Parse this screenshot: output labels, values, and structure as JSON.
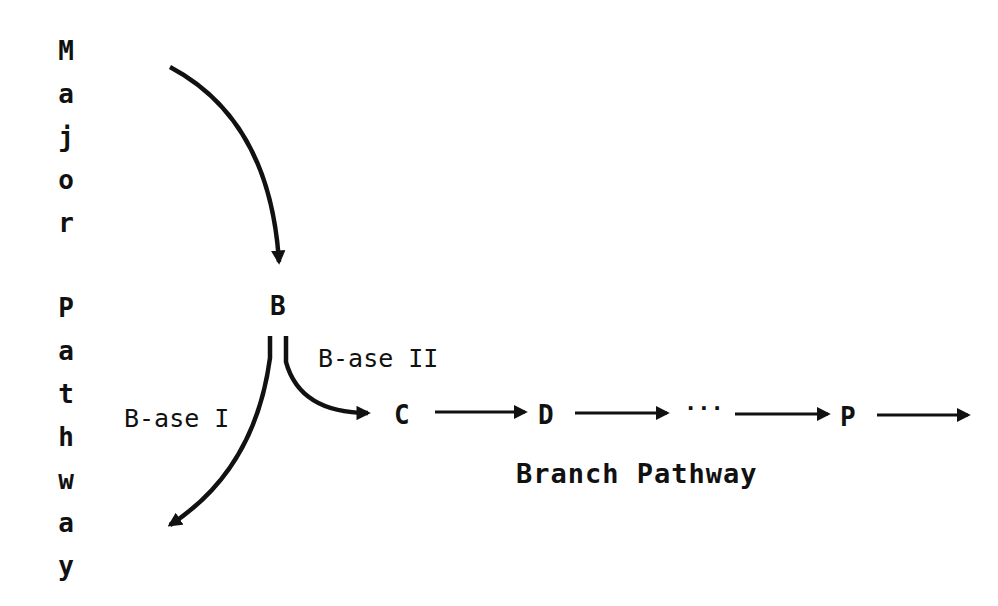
{
  "major_pathway": {
    "label": "Major Pathway",
    "letters": [
      "M",
      "a",
      "j",
      "o",
      "r",
      "P",
      "a",
      "t",
      "h",
      "w",
      "a",
      "y"
    ]
  },
  "nodes": {
    "b": "B",
    "c": "C",
    "d": "D",
    "ellipsis": "···",
    "p": "P"
  },
  "enzymes": {
    "b_ase_1": "B-ase I",
    "b_ase_2": "B-ase II"
  },
  "branch_pathway": {
    "label": "Branch Pathway"
  },
  "colors": {
    "ink": "#111111",
    "background": "#ffffff"
  }
}
